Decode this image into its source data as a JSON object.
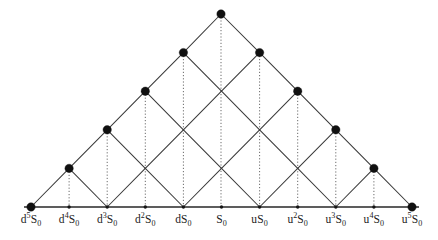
{
  "figure": {
    "colors": {
      "background": "#ffffff",
      "edge": "#3a3a3a",
      "drop_line": "#6b6b6b",
      "axis": "#5d5d5d",
      "node": "#101010",
      "label_text": "#1b1b1b"
    }
  },
  "chart_data": {
    "type": "diagram",
    "subtype": "recombining-binomial-lattice",
    "steps": 5,
    "xlabel": "",
    "ylabel": "",
    "grid": false,
    "legend": null,
    "geometry": {
      "baseline_y": 207,
      "apex": {
        "x": 221,
        "y": 14
      },
      "x_start": 31,
      "x_step": 38.1,
      "level_height": 38.6,
      "big_node_radius": 4.2,
      "small_node_radius": 1.7
    },
    "axis_labels": [
      {
        "index": 0,
        "base": "d",
        "exponent": "5",
        "stock": "S",
        "subscript": "0",
        "text": "d5S0",
        "x": 31.0
      },
      {
        "index": 1,
        "base": "d",
        "exponent": "4",
        "stock": "S",
        "subscript": "0",
        "text": "d4S0",
        "x": 69.1
      },
      {
        "index": 2,
        "base": "d",
        "exponent": "3",
        "stock": "S",
        "subscript": "0",
        "text": "d3S0",
        "x": 107.2
      },
      {
        "index": 3,
        "base": "d",
        "exponent": "2",
        "stock": "S",
        "subscript": "0",
        "text": "d2S0",
        "x": 145.3
      },
      {
        "index": 4,
        "base": "d",
        "exponent": "",
        "stock": "S",
        "subscript": "0",
        "text": "dS0",
        "x": 183.4
      },
      {
        "index": 5,
        "base": "",
        "exponent": "",
        "stock": "S",
        "subscript": "0",
        "text": "S0",
        "x": 221.5
      },
      {
        "index": 6,
        "base": "u",
        "exponent": "",
        "stock": "S",
        "subscript": "0",
        "text": "uS0",
        "x": 259.6
      },
      {
        "index": 7,
        "base": "u",
        "exponent": "2",
        "stock": "S",
        "subscript": "0",
        "text": "u2S0",
        "x": 297.7
      },
      {
        "index": 8,
        "base": "u",
        "exponent": "3",
        "stock": "S",
        "subscript": "0",
        "text": "u3S0",
        "x": 335.8
      },
      {
        "index": 9,
        "base": "u",
        "exponent": "4",
        "stock": "S",
        "subscript": "0",
        "text": "u4S0",
        "x": 373.9
      },
      {
        "index": 10,
        "base": "u",
        "exponent": "5",
        "stock": "S",
        "subscript": "0",
        "text": "u5S0",
        "x": 412.0
      }
    ],
    "nodes": [
      {
        "level": 0,
        "slot": 0,
        "x": 221.0,
        "y": 14.0,
        "kind": "big",
        "label": "S0"
      },
      {
        "level": 1,
        "slot": -1,
        "x": 183.4,
        "y": 52.6,
        "kind": "big",
        "label": "dS0"
      },
      {
        "level": 1,
        "slot": 1,
        "x": 259.6,
        "y": 52.6,
        "kind": "big",
        "label": "uS0"
      },
      {
        "level": 2,
        "slot": -2,
        "x": 145.3,
        "y": 91.2,
        "kind": "big",
        "label": "d2S0"
      },
      {
        "level": 2,
        "slot": 0,
        "x": 221.5,
        "y": 91.2,
        "kind": "cross",
        "label": "S0"
      },
      {
        "level": 2,
        "slot": 2,
        "x": 297.7,
        "y": 91.2,
        "kind": "big",
        "label": "u2S0"
      },
      {
        "level": 3,
        "slot": -3,
        "x": 107.2,
        "y": 129.8,
        "kind": "big",
        "label": "d3S0"
      },
      {
        "level": 3,
        "slot": -1,
        "x": 183.4,
        "y": 129.8,
        "kind": "cross",
        "label": "dS0"
      },
      {
        "level": 3,
        "slot": 1,
        "x": 259.6,
        "y": 129.8,
        "kind": "cross",
        "label": "uS0"
      },
      {
        "level": 3,
        "slot": 3,
        "x": 335.8,
        "y": 129.8,
        "kind": "big",
        "label": "u3S0"
      },
      {
        "level": 4,
        "slot": -4,
        "x": 69.1,
        "y": 168.4,
        "kind": "big",
        "label": "d4S0"
      },
      {
        "level": 4,
        "slot": -2,
        "x": 145.3,
        "y": 168.4,
        "kind": "cross",
        "label": "d2S0"
      },
      {
        "level": 4,
        "slot": 0,
        "x": 221.5,
        "y": 168.4,
        "kind": "cross",
        "label": "S0"
      },
      {
        "level": 4,
        "slot": 2,
        "x": 297.7,
        "y": 168.4,
        "kind": "cross",
        "label": "u2S0"
      },
      {
        "level": 4,
        "slot": 4,
        "x": 373.9,
        "y": 168.4,
        "kind": "big",
        "label": "u4S0"
      },
      {
        "level": 5,
        "slot": -5,
        "x": 31.0,
        "y": 207.0,
        "kind": "big",
        "label": "d5S0"
      },
      {
        "level": 5,
        "slot": -3,
        "x": 107.2,
        "y": 207.0,
        "kind": "small",
        "label": "d3S0"
      },
      {
        "level": 5,
        "slot": -1,
        "x": 183.4,
        "y": 207.0,
        "kind": "small",
        "label": "dS0"
      },
      {
        "level": 5,
        "slot": 1,
        "x": 259.6,
        "y": 207.0,
        "kind": "small",
        "label": "uS0"
      },
      {
        "level": 5,
        "slot": 3,
        "x": 335.8,
        "y": 207.0,
        "kind": "small",
        "label": "u3S0"
      },
      {
        "level": 5,
        "slot": 5,
        "x": 412.0,
        "y": 207.0,
        "kind": "big",
        "label": "u5S0"
      }
    ],
    "baseline_minor_ticks": [
      {
        "x": 69.1,
        "y": 207.0,
        "label": "d4S0"
      },
      {
        "x": 145.3,
        "y": 207.0,
        "label": "d2S0"
      },
      {
        "x": 221.5,
        "y": 207.0,
        "label": "S0"
      },
      {
        "x": 297.7,
        "y": 207.0,
        "label": "u2S0"
      },
      {
        "x": 373.9,
        "y": 207.0,
        "label": "u4S0"
      }
    ],
    "drop_lines": [
      {
        "x": 221.0,
        "y_top": 14.0,
        "y_bottom": 207.0
      },
      {
        "x": 183.4,
        "y_top": 52.6,
        "y_bottom": 207.0
      },
      {
        "x": 259.6,
        "y_top": 52.6,
        "y_bottom": 207.0
      },
      {
        "x": 145.3,
        "y_top": 91.2,
        "y_bottom": 207.0
      },
      {
        "x": 297.7,
        "y_top": 91.2,
        "y_bottom": 207.0
      },
      {
        "x": 107.2,
        "y_top": 129.8,
        "y_bottom": 207.0
      },
      {
        "x": 335.8,
        "y_top": 129.8,
        "y_bottom": 207.0
      },
      {
        "x": 69.1,
        "y_top": 168.4,
        "y_bottom": 207.0
      },
      {
        "x": 373.9,
        "y_top": 168.4,
        "y_bottom": 207.0
      }
    ]
  }
}
